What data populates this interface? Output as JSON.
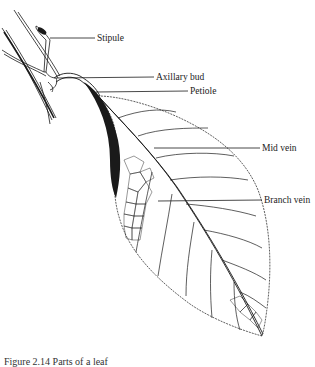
{
  "figure": {
    "caption_number": "Figure 2.14",
    "caption_text": "Parts of a leaf"
  },
  "labels": {
    "stipule": "Stipule",
    "axillary_bud": "Axillary bud",
    "petiole": "Petiole",
    "mid_vein": "Mid vein",
    "branch_vein": "Branch vein"
  },
  "colors": {
    "ink": "#1a1a1a",
    "background": "#ffffff"
  }
}
